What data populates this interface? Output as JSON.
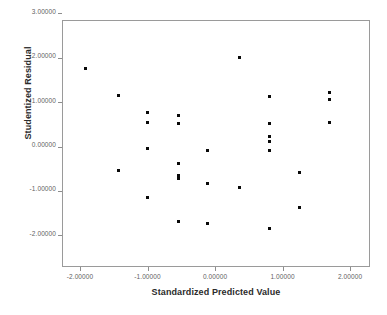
{
  "chart_data": {
    "type": "scatter",
    "title": "",
    "xlabel": "Standardized Predicted Value",
    "ylabel": "Studentized Residual",
    "xlim": [
      -2.27,
      2.3
    ],
    "ylim": [
      -2.36,
      3.36
    ],
    "grid": false,
    "legend": null,
    "x_ticks": [
      -2,
      -1,
      0,
      1,
      2
    ],
    "y_ticks": [
      3,
      2,
      1,
      0,
      -1,
      -2
    ],
    "x_tick_labels": [
      "-2.00000",
      "-1.00000",
      "0.00000",
      "1.00000",
      "2.00000"
    ],
    "y_tick_labels": [
      "3.00000",
      "2.00000",
      "1.00000",
      "0.00000",
      "-1.00000",
      "-2.00000"
    ],
    "marker_color": "#0a0a0a",
    "points": [
      {
        "x": -1.93,
        "y": 1.79
      },
      {
        "x": -1.45,
        "y": 1.19
      },
      {
        "x": -1.45,
        "y": -0.5
      },
      {
        "x": -1.01,
        "y": 0.79
      },
      {
        "x": -1.01,
        "y": 0.57
      },
      {
        "x": -1.01,
        "y": -0.02
      },
      {
        "x": -1.01,
        "y": -1.11
      },
      {
        "x": -0.56,
        "y": 0.74
      },
      {
        "x": -0.56,
        "y": 0.56
      },
      {
        "x": -0.56,
        "y": -0.36
      },
      {
        "x": -0.56,
        "y": -0.61
      },
      {
        "x": -0.56,
        "y": -0.69
      },
      {
        "x": -0.56,
        "y": -1.66
      },
      {
        "x": -0.13,
        "y": -0.05
      },
      {
        "x": -0.13,
        "y": -0.81
      },
      {
        "x": -0.13,
        "y": -1.69
      },
      {
        "x": 0.35,
        "y": 2.04
      },
      {
        "x": 0.35,
        "y": -0.9
      },
      {
        "x": 0.79,
        "y": 1.15
      },
      {
        "x": 0.79,
        "y": 0.56
      },
      {
        "x": 0.79,
        "y": 0.27
      },
      {
        "x": 0.79,
        "y": 0.14
      },
      {
        "x": 0.79,
        "y": -0.06
      },
      {
        "x": 0.79,
        "y": -1.82
      },
      {
        "x": 1.23,
        "y": -0.55
      },
      {
        "x": 1.23,
        "y": -1.35
      },
      {
        "x": 1.68,
        "y": 1.24
      },
      {
        "x": 1.68,
        "y": 1.1
      },
      {
        "x": 1.68,
        "y": 0.58
      }
    ]
  },
  "axes": {
    "x_title": "Standardized Predicted Value",
    "y_title": "Studentized Residual"
  }
}
